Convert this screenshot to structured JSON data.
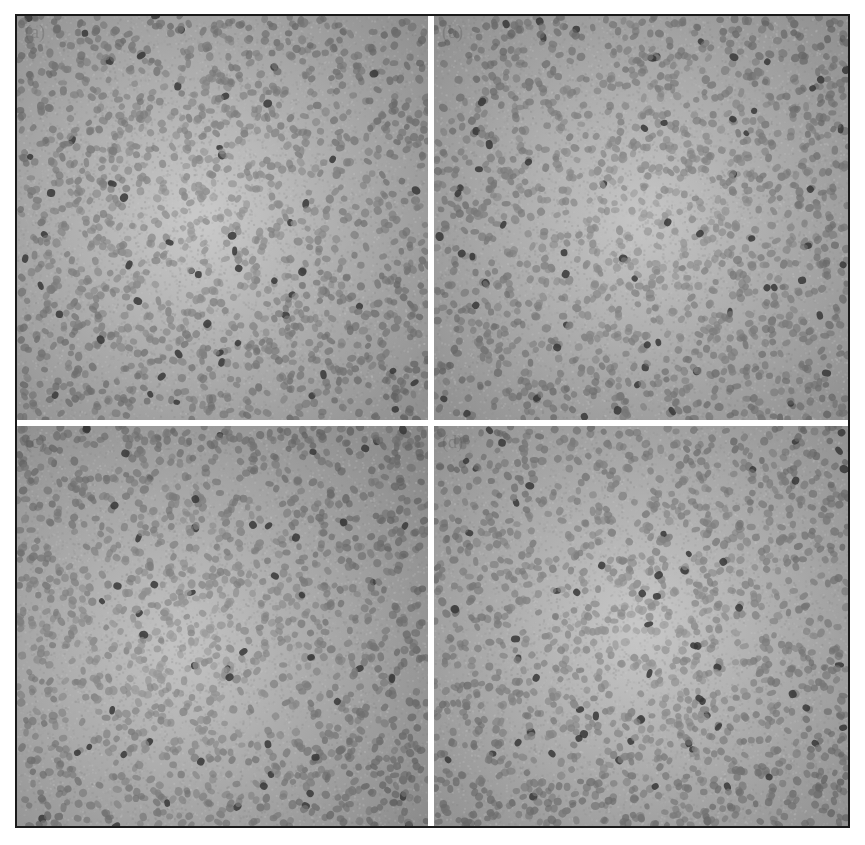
{
  "figure": {
    "background_color": "#ffffff",
    "frame_color": "#1a1a1a",
    "divider_color": "#ffffff",
    "panels": [
      {
        "id": "a",
        "label": "(a)",
        "center_brightness": "#c8c8c8",
        "edge_brightness": "#8c8c8c",
        "bright_center": [
          0.45,
          0.5
        ]
      },
      {
        "id": "b",
        "label": "(b)",
        "center_brightness": "#c4c4c4",
        "edge_brightness": "#8a8a8a",
        "bright_center": [
          0.5,
          0.5
        ]
      },
      {
        "id": "c",
        "label": "(c)",
        "center_brightness": "#c2c2c2",
        "edge_brightness": "#8a8a8a",
        "bright_center": [
          0.4,
          0.55
        ]
      },
      {
        "id": "d",
        "label": "(d)",
        "center_brightness": "#c6c6c6",
        "edge_brightness": "#8c8c8c",
        "bright_center": [
          0.5,
          0.5
        ]
      }
    ],
    "particle_color": "#6e6e6e",
    "particle_dark_color": "#3a3a3a"
  }
}
